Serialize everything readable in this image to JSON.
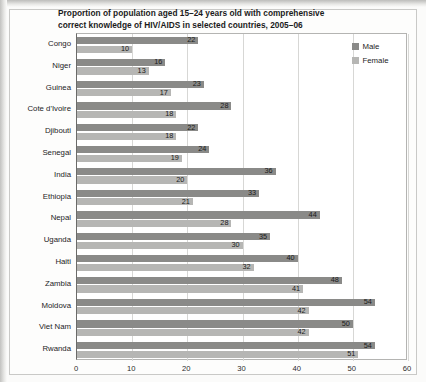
{
  "chart_data": {
    "type": "bar",
    "orientation": "horizontal",
    "title": "Proportion of population aged 15–24 years old with comprehensive correct knowledge of HIV/AIDS in selected countries, 2005–06",
    "title_line1": "Proportion of population aged 15–24 years old with comprehensive",
    "title_line2": "correct knowledge of HIV/AIDS in selected countries, 2005–06",
    "xlabel": "",
    "ylabel": "",
    "xlim": [
      0,
      60
    ],
    "xticks": [
      0,
      10,
      20,
      30,
      40,
      50,
      60
    ],
    "xtick_labels": [
      "0",
      "10",
      "20",
      "30",
      "40",
      "50",
      "60"
    ],
    "grid": true,
    "grid_axis": "x",
    "legend_position": "right",
    "categories": [
      "Congo",
      "Niger",
      "Guinea",
      "Cote d'Ivoire",
      "Djibouti",
      "Senegal",
      "India",
      "Ethiopia",
      "Nepal",
      "Uganda",
      "Haiti",
      "Zambia",
      "Moldova",
      "Viet Nam",
      "Rwanda"
    ],
    "series": [
      {
        "name": "Male",
        "color": "#8a8a88",
        "values": [
          22,
          16,
          23,
          28,
          22,
          24,
          36,
          33,
          44,
          35,
          40,
          48,
          54,
          50,
          54
        ]
      },
      {
        "name": "Female",
        "color": "#b6b6b4",
        "values": [
          10,
          13,
          17,
          18,
          18,
          19,
          20,
          21,
          28,
          30,
          32,
          41,
          42,
          42,
          51
        ]
      }
    ],
    "legend": [
      "Male",
      "Female"
    ]
  },
  "colors": {
    "male": "#8a8a88",
    "female": "#b6b6b4",
    "grid": "#d7d7d5",
    "axis": "#6b6b69",
    "text": "#1b1b1b",
    "page_background": "#fbfbfa",
    "plot_background": "#ffffff"
  }
}
